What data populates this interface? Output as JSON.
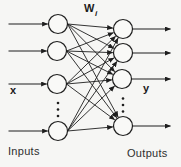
{
  "diagram": {
    "type": "fully-connected-neural-network",
    "colors": {
      "background": "#f6f6f4",
      "stroke": "#1e1e1e",
      "node_fill": "#f9f9f7",
      "text": "#1a1a1a"
    },
    "node_radius": 9.5,
    "input_nodes": [
      {
        "id": "input-node-1",
        "cx": 58,
        "cy": 24
      },
      {
        "id": "input-node-2",
        "cx": 57,
        "cy": 51
      },
      {
        "id": "input-node-3",
        "cx": 57,
        "cy": 84
      },
      {
        "id": "input-node-4",
        "cx": 58,
        "cy": 131
      }
    ],
    "output_nodes": [
      {
        "id": "output-node-1",
        "cx": 123,
        "cy": 29
      },
      {
        "id": "output-node-2",
        "cx": 123,
        "cy": 53
      },
      {
        "id": "output-node-3",
        "cx": 122,
        "cy": 79
      },
      {
        "id": "output-node-4",
        "cx": 123,
        "cy": 126
      }
    ],
    "connections": "all-to-all",
    "input_arrow_start_x": 8.5,
    "output_arrow_end_x": 170.5,
    "ellipsis_dots": {
      "left": {
        "cx": 58,
        "ys": [
          103,
          109.5,
          116
        ]
      },
      "right": {
        "cx": 123,
        "ys": [
          98.5,
          105,
          111.5
        ]
      }
    },
    "labels": {
      "weights": {
        "base": "W",
        "subscript": "i"
      },
      "input_vector": "x",
      "output_vector": "y",
      "inputs_caption": "Inputs",
      "outputs_caption": "Outputs"
    }
  }
}
